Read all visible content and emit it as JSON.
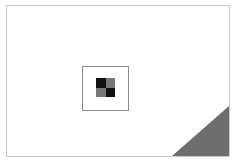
{
  "slide": {
    "background": "#ffffff",
    "border_color": "#c8c8c8"
  },
  "image_placeholder": {
    "icon": "image-placeholder-icon",
    "border_color": "#8a8a8a"
  },
  "colors": {
    "checker_dark": "#111111",
    "checker_mid": "#777777",
    "corner_fold": "#6e6e6e"
  },
  "caption": {
    "text": ""
  }
}
